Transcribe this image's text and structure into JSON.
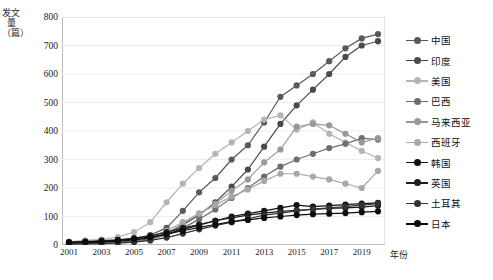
{
  "chart_data": {
    "type": "line",
    "title": "",
    "xlabel": "年份",
    "ylabel": "发文量（篇）",
    "grid": true,
    "legend_position": "right",
    "ylim": [
      0,
      800
    ],
    "ytick_step": 100,
    "yticks": [
      "800",
      "700",
      "600",
      "500",
      "400",
      "300",
      "200",
      "100",
      "0"
    ],
    "x": [
      2001,
      2002,
      2003,
      2004,
      2005,
      2006,
      2007,
      2008,
      2009,
      2010,
      2011,
      2012,
      2013,
      2014,
      2015,
      2016,
      2017,
      2018,
      2019,
      2020
    ],
    "xtick_labels": [
      "2001",
      "2003",
      "2005",
      "2007",
      "2009",
      "2011",
      "2013",
      "2015",
      "2017",
      "2019"
    ],
    "xtick_values": [
      2001,
      2003,
      2005,
      2007,
      2009,
      2011,
      2013,
      2015,
      2017,
      2019
    ],
    "series": [
      {
        "name": "中国",
        "color": "#5a5a5a",
        "values": [
          8,
          10,
          12,
          15,
          22,
          35,
          60,
          120,
          185,
          235,
          300,
          350,
          430,
          520,
          560,
          600,
          645,
          690,
          725,
          740
        ]
      },
      {
        "name": "印度",
        "color": "#4a4a4a",
        "values": [
          5,
          6,
          8,
          10,
          14,
          22,
          40,
          70,
          105,
          150,
          205,
          265,
          345,
          425,
          490,
          545,
          600,
          660,
          700,
          715
        ]
      },
      {
        "name": "美国",
        "color": "#b5b5b5",
        "values": [
          12,
          16,
          20,
          28,
          45,
          80,
          150,
          215,
          270,
          320,
          360,
          400,
          440,
          455,
          405,
          430,
          390,
          360,
          330,
          305
        ]
      },
      {
        "name": "巴西",
        "color": "#6e6e6e",
        "values": [
          4,
          5,
          7,
          9,
          13,
          20,
          35,
          60,
          90,
          125,
          165,
          200,
          240,
          275,
          300,
          320,
          340,
          355,
          375,
          370
        ]
      },
      {
        "name": "马来西亚",
        "color": "#999999",
        "values": [
          2,
          3,
          4,
          6,
          10,
          18,
          40,
          75,
          110,
          145,
          190,
          230,
          290,
          335,
          415,
          425,
          420,
          390,
          360,
          375
        ]
      },
      {
        "name": "西班牙",
        "color": "#a8a8a8",
        "values": [
          6,
          8,
          10,
          13,
          18,
          28,
          50,
          80,
          110,
          140,
          170,
          195,
          225,
          250,
          250,
          240,
          230,
          215,
          200,
          260
        ]
      },
      {
        "name": "韩国",
        "color": "#111111",
        "values": [
          6,
          8,
          10,
          13,
          18,
          25,
          38,
          55,
          70,
          85,
          100,
          110,
          120,
          130,
          140,
          135,
          138,
          142,
          145,
          148
        ]
      },
      {
        "name": "英国",
        "color": "#1c1c1c",
        "values": [
          10,
          12,
          15,
          18,
          24,
          32,
          45,
          60,
          72,
          85,
          95,
          105,
          112,
          118,
          122,
          125,
          128,
          130,
          133,
          138
        ]
      },
      {
        "name": "土耳其",
        "color": "#333333",
        "values": [
          3,
          4,
          5,
          7,
          10,
          16,
          26,
          40,
          55,
          68,
          80,
          92,
          105,
          112,
          120,
          126,
          130,
          135,
          140,
          145
        ]
      },
      {
        "name": "日本",
        "color": "#0d0d0d",
        "values": [
          9,
          11,
          13,
          16,
          21,
          28,
          38,
          50,
          62,
          72,
          82,
          88,
          95,
          100,
          105,
          108,
          110,
          112,
          115,
          118
        ]
      }
    ]
  }
}
